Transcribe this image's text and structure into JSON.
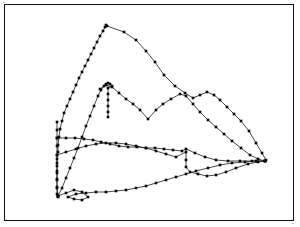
{
  "figure": {
    "title": "",
    "background_color": "#ffffff",
    "frame_color": "#141414",
    "line_color": "#1a1a1a",
    "marker_color": "#080808",
    "marker_shape": "square",
    "marker_size_px": 2.6,
    "frame": {
      "x": 4,
      "y": 4,
      "width": 290,
      "height": 217
    }
  },
  "chart_data": {
    "type": "line",
    "title": "",
    "subtitle": "",
    "xlabel": "",
    "ylabel": "",
    "xlim": [
      0,
      300
    ],
    "ylim": [
      227,
      0
    ],
    "grid": false,
    "legend": "none",
    "axis_visible": false,
    "tick_labels_x": [],
    "tick_labels_y": [],
    "annotations": [],
    "note": "Four unlabelled polyline series with square markers forming a closed fan/leaf outline; coordinates are in image pixel space (y increases downward).",
    "series": [
      {
        "name": "series-1-upper-ridge",
        "marker": "square",
        "points": [
          [
            106,
            25
          ],
          [
            107,
            26
          ],
          [
            124,
            32
          ],
          [
            136,
            40
          ],
          [
            146,
            51
          ],
          [
            155,
            62
          ],
          [
            164,
            75
          ],
          [
            175,
            86
          ],
          [
            185,
            93
          ],
          [
            193,
            98
          ],
          [
            200,
            95
          ],
          [
            207,
            92
          ],
          [
            214,
            95
          ],
          [
            220,
            100
          ],
          [
            227,
            107
          ],
          [
            234,
            114
          ],
          [
            241,
            121
          ],
          [
            249,
            131
          ],
          [
            256,
            143
          ],
          [
            262,
            153
          ],
          [
            266,
            160
          ]
        ]
      },
      {
        "name": "series-2-left-descent",
        "marker": "square",
        "points": [
          [
            105,
            27
          ],
          [
            103,
            31
          ],
          [
            100,
            36
          ],
          [
            97,
            42
          ],
          [
            94,
            48
          ],
          [
            91,
            54
          ],
          [
            88,
            60
          ],
          [
            85,
            66
          ],
          [
            82,
            72
          ],
          [
            79,
            78
          ],
          [
            76,
            85
          ],
          [
            73,
            92
          ],
          [
            70,
            99
          ],
          [
            67,
            106
          ],
          [
            64,
            113
          ],
          [
            62,
            121
          ],
          [
            60,
            129
          ],
          [
            59,
            137
          ],
          [
            58,
            145
          ],
          [
            58,
            152
          ],
          [
            57,
            159
          ],
          [
            57,
            166
          ],
          [
            57,
            173
          ],
          [
            57,
            180
          ],
          [
            57,
            187
          ],
          [
            57,
            194
          ],
          [
            58,
            197
          ]
        ]
      },
      {
        "name": "series-3-mid-spine",
        "marker": "square",
        "points": [
          [
            58,
            196
          ],
          [
            62,
            188
          ],
          [
            66,
            178
          ],
          [
            70,
            168
          ],
          [
            74,
            158
          ],
          [
            78,
            148
          ],
          [
            82,
            137
          ],
          [
            86,
            126
          ],
          [
            90,
            116
          ],
          [
            94,
            106
          ],
          [
            98,
            96
          ],
          [
            101,
            90
          ],
          [
            104,
            86
          ],
          [
            106,
            84
          ],
          [
            108,
            83
          ],
          [
            110,
            84
          ],
          [
            112,
            86
          ],
          [
            108,
            88
          ],
          [
            108,
            94
          ],
          [
            108,
            100
          ],
          [
            108,
            106
          ],
          [
            108,
            112
          ],
          [
            108,
            117
          ]
        ]
      },
      {
        "name": "series-4-mid-band",
        "marker": "square",
        "points": [
          [
            100,
            89
          ],
          [
            106,
            85
          ],
          [
            112,
            87
          ],
          [
            119,
            93
          ],
          [
            126,
            99
          ],
          [
            133,
            104
          ],
          [
            140,
            110
          ],
          [
            148,
            119
          ],
          [
            156,
            110
          ],
          [
            163,
            104
          ],
          [
            171,
            99
          ],
          [
            180,
            94
          ],
          [
            186,
            96
          ],
          [
            193,
            104
          ],
          [
            200,
            112
          ],
          [
            208,
            120
          ],
          [
            216,
            127
          ],
          [
            224,
            134
          ],
          [
            232,
            141
          ],
          [
            241,
            148
          ],
          [
            250,
            155
          ],
          [
            258,
            159
          ],
          [
            265,
            161
          ]
        ]
      },
      {
        "name": "series-5-lower-band",
        "marker": "square",
        "points": [
          [
            57,
            138
          ],
          [
            66,
            138
          ],
          [
            75,
            138
          ],
          [
            84,
            139
          ],
          [
            93,
            140
          ],
          [
            101,
            142
          ],
          [
            110,
            144
          ],
          [
            119,
            146
          ],
          [
            128,
            147
          ],
          [
            137,
            147
          ],
          [
            146,
            148
          ],
          [
            155,
            148
          ],
          [
            164,
            149
          ],
          [
            173,
            150
          ],
          [
            182,
            151
          ],
          [
            186,
            149
          ],
          [
            195,
            153
          ],
          [
            205,
            157
          ],
          [
            216,
            160
          ],
          [
            228,
            161
          ],
          [
            240,
            161
          ],
          [
            252,
            161
          ],
          [
            265,
            161
          ]
        ]
      },
      {
        "name": "series-6-lower-arc",
        "marker": "square",
        "points": [
          [
            57,
            155
          ],
          [
            66,
            152
          ],
          [
            76,
            149
          ],
          [
            86,
            146
          ],
          [
            96,
            144
          ],
          [
            106,
            143
          ],
          [
            116,
            143
          ],
          [
            126,
            144
          ],
          [
            136,
            146
          ],
          [
            146,
            148
          ],
          [
            156,
            151
          ],
          [
            166,
            154
          ],
          [
            176,
            157
          ],
          [
            186,
            152
          ],
          [
            186,
            160
          ],
          [
            186,
            167
          ],
          [
            190,
            172
          ],
          [
            198,
            174
          ],
          [
            207,
            176
          ],
          [
            216,
            175
          ],
          [
            226,
            172
          ],
          [
            236,
            168
          ],
          [
            248,
            164
          ],
          [
            258,
            162
          ],
          [
            265,
            161
          ]
        ]
      },
      {
        "name": "series-7-bottom-outline",
        "marker": "square",
        "points": [
          [
            58,
            196
          ],
          [
            66,
            193
          ],
          [
            74,
            190
          ],
          [
            82,
            192
          ],
          [
            88,
            197
          ],
          [
            82,
            200
          ],
          [
            74,
            199
          ],
          [
            68,
            197
          ],
          [
            76,
            194
          ],
          [
            86,
            193
          ],
          [
            96,
            192
          ],
          [
            106,
            192
          ],
          [
            116,
            191
          ],
          [
            126,
            190
          ],
          [
            136,
            188
          ],
          [
            146,
            186
          ],
          [
            156,
            183
          ],
          [
            166,
            180
          ],
          [
            176,
            177
          ],
          [
            186,
            174
          ],
          [
            196,
            171
          ],
          [
            208,
            168
          ],
          [
            220,
            165
          ],
          [
            232,
            163
          ],
          [
            245,
            162
          ],
          [
            256,
            161
          ],
          [
            265,
            161
          ]
        ]
      },
      {
        "name": "series-8-left-cluster",
        "marker": "square",
        "points": [
          [
            57,
            122
          ],
          [
            57,
            130
          ],
          [
            57,
            138
          ],
          [
            57,
            146
          ],
          [
            57,
            155
          ],
          [
            57,
            163
          ],
          [
            57,
            171
          ],
          [
            57,
            179
          ],
          [
            57,
            188
          ],
          [
            58,
            196
          ]
        ]
      }
    ]
  }
}
